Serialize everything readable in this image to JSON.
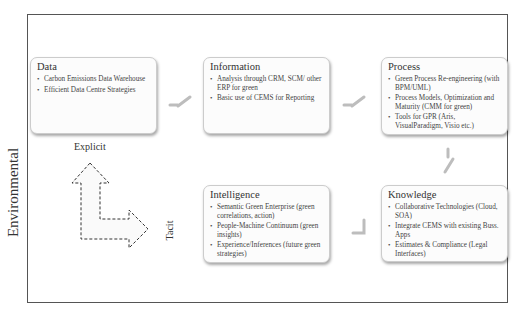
{
  "diagram": {
    "side_label": "Environmental",
    "axis": {
      "explicit_label": "Explicit",
      "tacit_label": "Tacit"
    },
    "boxes": {
      "data": {
        "title": "Data",
        "items": [
          "Carbon Emissions Data Warehouse",
          "Efficient Data Centre Strategies"
        ]
      },
      "information": {
        "title": "Information",
        "items": [
          "Analysis through CRM, SCM/ other ERP for green",
          "Basic use of CEMS for Reporting"
        ]
      },
      "process": {
        "title": "Process",
        "items": [
          "Green Process Re-engineering (with BPM/UML)",
          "Process Models, Optimization and Maturity (CMM for green)",
          "Tools for GPR (Aris, VisualParadigm, Visio etc.)"
        ]
      },
      "knowledge": {
        "title": "Knowledge",
        "items": [
          "Collaborative Technologies (Cloud, SOA)",
          "Integrate CEMS with existing Buss. Apps",
          "Estimates & Compliance (Legal Interfaces)"
        ]
      },
      "intelligence": {
        "title": "Intelligence",
        "items": [
          "Semantic Green Enterprise (green correlations, action)",
          "People-Machine Continuum (green insights)",
          "Experience/Inferences (future green strategies)"
        ]
      }
    },
    "flow": [
      "Data",
      "Information",
      "Process",
      "Knowledge",
      "Intelligence"
    ],
    "colors": {
      "frame": "#555555",
      "box_border": "#cccccc",
      "box_fill": "#fcfcfc",
      "connector": "#bdbdbd",
      "arrow_dash": "#333333"
    }
  }
}
